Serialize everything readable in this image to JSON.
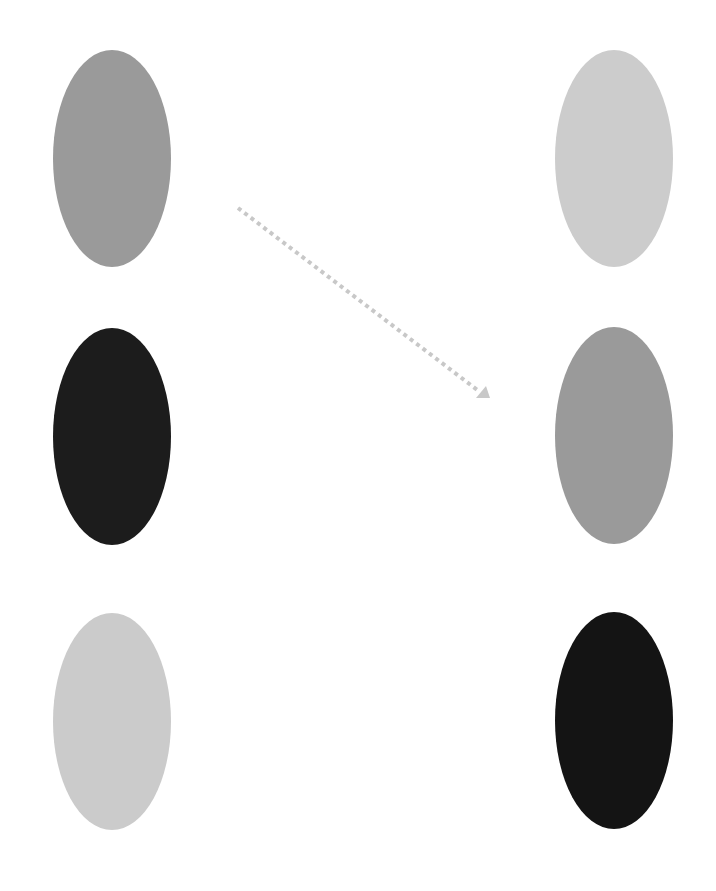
{
  "diagram": {
    "left_column": [
      {
        "id": "left-top",
        "color": "#9a9a9a",
        "x": 53,
        "y": 50
      },
      {
        "id": "left-middle",
        "color": "#1c1c1c",
        "x": 53,
        "y": 328
      },
      {
        "id": "left-bottom",
        "color": "#cbcbcb",
        "x": 53,
        "y": 613
      }
    ],
    "right_column": [
      {
        "id": "right-top",
        "color": "#cccccc",
        "x": 555,
        "y": 50
      },
      {
        "id": "right-middle",
        "color": "#9a9a9a",
        "x": 555,
        "y": 327
      },
      {
        "id": "right-bottom",
        "color": "#141414",
        "x": 555,
        "y": 612
      }
    ],
    "arrow": {
      "style": "dotted",
      "color": "#c8c8c8",
      "from": [
        238,
        208
      ],
      "to": [
        487,
        398
      ]
    }
  }
}
